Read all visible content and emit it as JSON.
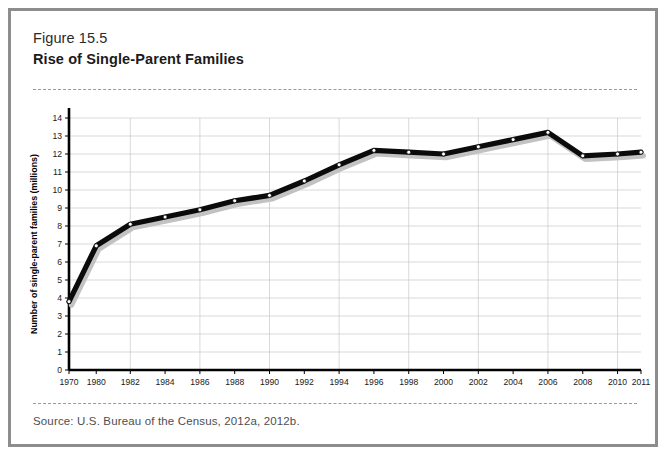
{
  "figure": {
    "number": "Figure 15.5",
    "title": "Rise of Single-Parent Families",
    "source": "Source: U.S. Bureau of the Census, 2012a, 2012b."
  },
  "chart_data": {
    "type": "line",
    "title": "Rise of Single-Parent Families",
    "xlabel": "",
    "ylabel": "Number of single-parent families (millions)",
    "ylim": [
      0,
      14
    ],
    "xlim": [
      1970,
      2011
    ],
    "grid": true,
    "legend": "none",
    "y_ticks": [
      0,
      1,
      2,
      3,
      4,
      5,
      6,
      7,
      8,
      9,
      10,
      11,
      12,
      13,
      14
    ],
    "y_tick_labels": [
      "0",
      "1",
      "2",
      "3",
      "4",
      "5",
      "6",
      "7",
      "8",
      "9",
      "10",
      "11",
      "12",
      "13",
      "14"
    ],
    "x_tick_labels": [
      "1970",
      "1980",
      "1982",
      "1984",
      "1986",
      "1988",
      "1990",
      "1992",
      "1994",
      "1996",
      "1998",
      "2000",
      "2002",
      "2004",
      "2006",
      "2008",
      "2010",
      "2011"
    ],
    "categories": [
      1970,
      1980,
      1982,
      1984,
      1986,
      1988,
      1990,
      1992,
      1994,
      1996,
      1998,
      2000,
      2002,
      2004,
      2006,
      2008,
      2010,
      2011
    ],
    "values": [
      3.8,
      6.9,
      8.1,
      8.5,
      8.9,
      9.4,
      9.7,
      10.5,
      11.4,
      12.2,
      12.1,
      12.0,
      12.4,
      12.8,
      13.2,
      11.9,
      12.0,
      12.1
    ],
    "series": [
      {
        "name": "Single-parent families",
        "values": [
          3.8,
          6.9,
          8.1,
          8.5,
          8.9,
          9.4,
          9.7,
          10.5,
          11.4,
          12.2,
          12.1,
          12.0,
          12.4,
          12.8,
          13.2,
          11.9,
          12.0,
          12.1
        ]
      }
    ],
    "colors": {
      "line": "#0b0b0b",
      "shadow": "#c2c2c2",
      "marker_fill": "#ffffff",
      "grid": "#c9c9c9",
      "axis": "#000000"
    }
  }
}
